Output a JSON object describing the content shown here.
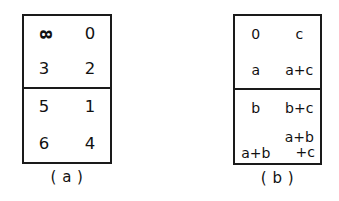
{
  "figure": {
    "background_color": "#ffffff",
    "ink_color": "#1a1a1a",
    "panels": [
      {
        "id": "a",
        "caption": "( a )",
        "halves": [
          {
            "id": "a-top",
            "rows": [
              {
                "left": "∞",
                "right": "0"
              },
              {
                "left": "3",
                "right": "2"
              }
            ]
          },
          {
            "id": "a-bottom",
            "rows": [
              {
                "left": "5",
                "right": "1"
              },
              {
                "left": "6",
                "right": "4"
              }
            ]
          }
        ]
      },
      {
        "id": "b",
        "caption": "( b )",
        "halves": [
          {
            "id": "b-top",
            "rows": [
              {
                "left": "0",
                "right": "c"
              },
              {
                "left": "a",
                "right": "a+c"
              }
            ]
          },
          {
            "id": "b-bottom",
            "rows": [
              {
                "left": "b",
                "right": "b+c"
              },
              {
                "left": "a+b",
                "right_line1": "a+b",
                "right_line2": "+c"
              }
            ]
          }
        ]
      }
    ]
  },
  "cells": {
    "a": {
      "r0c0": "∞",
      "r0c1": "0",
      "r1c0": "3",
      "r1c1": "2",
      "r2c0": "5",
      "r2c1": "1",
      "r3c0": "6",
      "r3c1": "4"
    },
    "b": {
      "r0c0": "0",
      "r0c1": "c",
      "r1c0": "a",
      "r1c1": "a+c",
      "r2c0": "b",
      "r2c1": "b+c",
      "r3c0": "a+b",
      "r3c1_line1": "a+b",
      "r3c1_line2": "+c"
    }
  },
  "captions": {
    "left": "( a )",
    "right": "( b )"
  },
  "glyphs": {
    "infinity_note": "8"
  }
}
